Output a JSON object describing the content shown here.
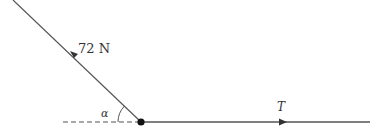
{
  "diagram": {
    "type": "force-diagram",
    "forces": [
      {
        "label": "72 N",
        "direction": "up-left along inclined line"
      },
      {
        "label": "T",
        "direction": "right along horizontal"
      }
    ],
    "angle_label": "α",
    "colors": {
      "line": "#555555",
      "dot": "#111111",
      "text": "#333333"
    }
  }
}
